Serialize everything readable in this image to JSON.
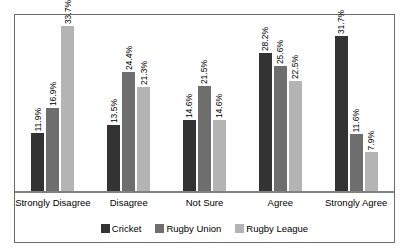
{
  "chart_data": {
    "type": "bar",
    "title": "",
    "xlabel": "",
    "ylabel": "",
    "ylim": [
      0,
      36
    ],
    "grid": false,
    "legend_position": "bottom",
    "categories": [
      "Strongly Disagree",
      "Disagree",
      "Not Sure",
      "Agree",
      "Strongly Agree"
    ],
    "series": [
      {
        "name": "Cricket",
        "color": "#333333",
        "values": [
          11.9,
          13.5,
          14.6,
          28.2,
          31.7
        ],
        "labels": [
          "11.9%",
          "13.5%",
          "14.6%",
          "28.2%",
          "31.7%"
        ]
      },
      {
        "name": "Rugby Union",
        "color": "#6e6e6e",
        "values": [
          16.9,
          24.4,
          21.5,
          25.6,
          11.6
        ],
        "labels": [
          "16.9%",
          "24.4%",
          "21.5%",
          "25.6%",
          "11.6%"
        ]
      },
      {
        "name": "Rugby League",
        "color": "#b4b4b4",
        "values": [
          33.7,
          21.3,
          14.6,
          22.5,
          7.9
        ],
        "labels": [
          "33.7%",
          "21.3%",
          "14.6%",
          "22.5%",
          "7.9%"
        ]
      }
    ]
  },
  "legend": {
    "items": [
      {
        "label": "Cricket",
        "color": "#333333"
      },
      {
        "label": "Rugby Union",
        "color": "#6e6e6e"
      },
      {
        "label": "Rugby League",
        "color": "#b4b4b4"
      }
    ]
  }
}
